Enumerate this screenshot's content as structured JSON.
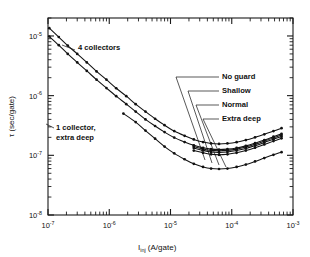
{
  "figure": {
    "background": "#ffffff",
    "ink_color": "#111111"
  },
  "chart_data": {
    "type": "line",
    "title": "",
    "xlabel": "Iinj (A/gate)",
    "xlabel_main": "I",
    "xlabel_sub": "inj",
    "xlabel_rest": "(A/gate)",
    "ylabel": "τ (sec/gate)",
    "xscale": "log",
    "yscale": "log",
    "xlim": [
      1e-07,
      0.001
    ],
    "ylim": [
      1e-08,
      2e-05
    ],
    "grid": false,
    "legend_position": "inline-annotations",
    "xticklabels": [
      {
        "mant": "10",
        "exp": "-7",
        "value": 1e-07
      },
      {
        "mant": "10",
        "exp": "-6",
        "value": 1e-06
      },
      {
        "mant": "10",
        "exp": "-5",
        "value": 1e-05
      },
      {
        "mant": "10",
        "exp": "-4",
        "value": 0.0001
      },
      {
        "mant": "10",
        "exp": "-3",
        "value": 0.001
      }
    ],
    "yticklabels": [
      {
        "mant": "10",
        "exp": "-8",
        "value": 1e-08
      },
      {
        "mant": "10",
        "exp": "-7",
        "value": 1e-07
      },
      {
        "mant": "10",
        "exp": "-6",
        "value": 1e-06
      },
      {
        "mant": "10",
        "exp": "-5",
        "value": 1e-05
      }
    ],
    "series": [
      {
        "name": "4 collectors",
        "marker": "dot",
        "x": [
          1.05e-07,
          1.5e-07,
          2.1e-07,
          3e-07,
          4.3e-07,
          6.2e-07,
          9e-07,
          1.3e-06,
          1.9e-06,
          2.7e-06,
          3.9e-06,
          5.6e-06,
          8e-06,
          1.15e-05,
          1.7e-05,
          2.4e-05,
          3.4e-05,
          4.6e-05,
          6.2e-05,
          8.5e-05,
          0.00012,
          0.00017,
          0.00024,
          0.00034,
          0.00048,
          0.00065
        ],
        "y": [
          1.35e-05,
          9.6e-06,
          6.9e-06,
          5e-06,
          3.6e-06,
          2.55e-06,
          1.85e-06,
          1.33e-06,
          9.8e-07,
          7.2e-07,
          5.4e-07,
          4.1e-07,
          3.2e-07,
          2.55e-07,
          2.12e-07,
          1.85e-07,
          1.67e-07,
          1.58e-07,
          1.55e-07,
          1.58e-07,
          1.66e-07,
          1.8e-07,
          2e-07,
          2.25e-07,
          2.55e-07,
          2.85e-07
        ]
      },
      {
        "name": "No guard",
        "marker": "dot",
        "x": [
          1.05e-07,
          1.5e-07,
          2.1e-07,
          3e-07,
          4.3e-07,
          6.2e-07,
          9e-07,
          1.3e-06,
          1.9e-06,
          2.7e-06,
          3.9e-06,
          5.6e-06,
          8e-06,
          1.15e-05,
          1.7e-05,
          2.4e-05,
          3.4e-05,
          4.6e-05,
          6.2e-05,
          8.5e-05,
          0.00012,
          0.00017,
          0.00024,
          0.00034,
          0.00048,
          0.00065
        ],
        "y": [
          9.8e-06,
          7e-06,
          5e-06,
          3.6e-06,
          2.6e-06,
          1.85e-06,
          1.34e-06,
          9.8e-07,
          7.2e-07,
          5.4e-07,
          4e-07,
          3.1e-07,
          2.45e-07,
          1.98e-07,
          1.67e-07,
          1.47e-07,
          1.34e-07,
          1.27e-07,
          1.25e-07,
          1.27e-07,
          1.33e-07,
          1.44e-07,
          1.6e-07,
          1.8e-07,
          2.05e-07,
          2.3e-07
        ]
      },
      {
        "name": "Shallow",
        "marker": "dot",
        "x": [
          2.4e-05,
          3.4e-05,
          4.6e-05,
          6.2e-05,
          8.5e-05,
          0.00012,
          0.00017,
          0.00024,
          0.00034,
          0.00048,
          0.00065
        ],
        "y": [
          1.4e-07,
          1.28e-07,
          1.21e-07,
          1.19e-07,
          1.21e-07,
          1.27e-07,
          1.38e-07,
          1.53e-07,
          1.73e-07,
          1.96e-07,
          2.18e-07
        ]
      },
      {
        "name": "Normal",
        "marker": "dot",
        "x": [
          2.4e-05,
          3.4e-05,
          4.6e-05,
          6.2e-05,
          8.5e-05,
          0.00012,
          0.00017,
          0.00024,
          0.00034,
          0.00048,
          0.00065
        ],
        "y": [
          1.33e-07,
          1.21e-07,
          1.14e-07,
          1.12e-07,
          1.14e-07,
          1.2e-07,
          1.3e-07,
          1.45e-07,
          1.64e-07,
          1.86e-07,
          2.06e-07
        ]
      },
      {
        "name": "Extra deep",
        "marker": "dot",
        "x": [
          2.4e-05,
          3.4e-05,
          4.6e-05,
          6.2e-05,
          8.5e-05,
          0.00012,
          0.00017,
          0.00024,
          0.00034,
          0.00048,
          0.00065
        ],
        "y": [
          1.2e-07,
          1.1e-07,
          1.04e-07,
          1.02e-07,
          1.04e-07,
          1.1e-07,
          1.2e-07,
          1.34e-07,
          1.52e-07,
          1.73e-07,
          1.93e-07
        ]
      },
      {
        "name": "1 collector, extra deep",
        "marker": "dot",
        "x": [
          1.7e-06,
          2.7e-06,
          3.9e-06,
          5.6e-06,
          8e-06,
          1.15e-05,
          1.7e-05,
          2.4e-05,
          3.4e-05,
          4.6e-05,
          6.2e-05,
          8.5e-05,
          0.00012,
          0.00017,
          0.00024,
          0.00034,
          0.00048,
          0.00065
        ],
        "y": [
          5e-07,
          3.6e-07,
          2.6e-07,
          1.9e-07,
          1.4e-07,
          1.08e-07,
          8.6e-08,
          7.2e-08,
          6.4e-08,
          6e-08,
          5.9e-08,
          6e-08,
          6.4e-08,
          7e-08,
          7.9e-08,
          9e-08,
          1.02e-07,
          1.13e-07
        ]
      }
    ],
    "annotations": [
      {
        "id": "four-collectors",
        "text": "4 collectors",
        "lines": [
          "4 collectors"
        ],
        "x_px": 78,
        "y_px": 50,
        "leader": [
          [
            75,
            50
          ],
          [
            62,
            45
          ]
        ]
      },
      {
        "id": "one-collector",
        "text": "1 collector, extra deep",
        "lines": [
          "1 collector,",
          "extra deep"
        ],
        "x_px": 56,
        "y_px": 130,
        "leader": [
          [
            54,
            128
          ],
          [
            46,
            124
          ]
        ]
      },
      {
        "id": "no-guard",
        "text": "No guard",
        "lines": [
          "No guard"
        ],
        "x_px": 222,
        "y_px": 79,
        "leader": [
          [
            219,
            77
          ],
          [
            176,
            77
          ],
          [
            205,
            160
          ]
        ]
      },
      {
        "id": "shallow",
        "text": "Shallow",
        "lines": [
          "Shallow"
        ],
        "x_px": 222,
        "y_px": 93,
        "leader": [
          [
            219,
            91
          ],
          [
            188,
            91
          ],
          [
            212,
            163
          ]
        ]
      },
      {
        "id": "normal",
        "text": "Normal",
        "lines": [
          "Normal"
        ],
        "x_px": 222,
        "y_px": 107,
        "leader": [
          [
            219,
            105
          ],
          [
            196,
            105
          ],
          [
            219,
            165
          ]
        ]
      },
      {
        "id": "extra-deep",
        "text": "Extra deep",
        "lines": [
          "Extra deep"
        ],
        "x_px": 222,
        "y_px": 121,
        "leader": [
          [
            219,
            119
          ],
          [
            203,
            119
          ],
          [
            226,
            167
          ]
        ]
      }
    ]
  }
}
